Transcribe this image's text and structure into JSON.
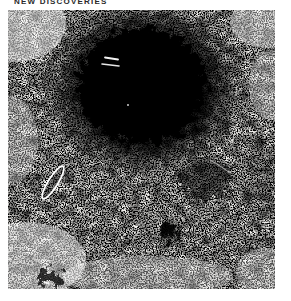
{
  "header": {
    "label": "NEW DISCOVERIES"
  },
  "figure": {
    "name": "photographic-plate-negative",
    "colors": {
      "paper": "#ffffff",
      "plate_background": "#f3f2ef",
      "grain": "#0a0a0a",
      "galaxy_blob": "#000000",
      "marker": "#ffffff"
    },
    "annotations": [
      {
        "name": "galaxy-ellipse-marker",
        "shape": "ellipse-outline",
        "color": "#ffffff"
      },
      {
        "name": "double-dash-marker",
        "shape": "two-white-dashes",
        "color": "#ffffff"
      },
      {
        "name": "diagonal-scratch",
        "shape": "thin-white-streak",
        "color": "#ffffff"
      }
    ]
  }
}
